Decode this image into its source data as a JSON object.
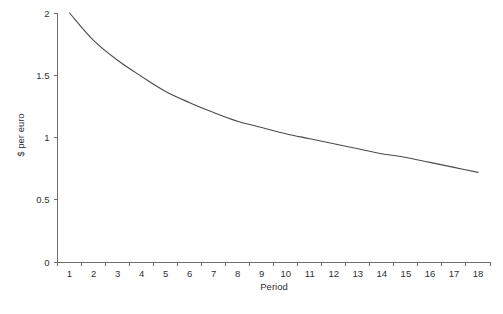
{
  "chart_data": {
    "type": "line",
    "title": "",
    "xlabel": "Period",
    "ylabel": "$ per euro",
    "x": [
      1,
      2,
      3,
      4,
      5,
      6,
      7,
      8,
      9,
      10,
      11,
      12,
      13,
      14,
      15,
      16,
      17,
      18
    ],
    "values": [
      2.0,
      1.78,
      1.62,
      1.49,
      1.37,
      1.28,
      1.2,
      1.13,
      1.08,
      1.03,
      0.99,
      0.95,
      0.91,
      0.87,
      0.84,
      0.8,
      0.76,
      0.72
    ],
    "series": [
      {
        "name": "$ per euro",
        "values": [
          2.0,
          1.78,
          1.62,
          1.49,
          1.37,
          1.28,
          1.2,
          1.13,
          1.08,
          1.03,
          0.99,
          0.95,
          0.91,
          0.87,
          0.84,
          0.8,
          0.76,
          0.72
        ]
      }
    ],
    "xlim": [
      1,
      18
    ],
    "ylim": [
      0,
      2
    ],
    "xticklabels": [
      "1",
      "2",
      "3",
      "4",
      "5",
      "6",
      "7",
      "8",
      "9",
      "10",
      "11",
      "12",
      "13",
      "14",
      "15",
      "16",
      "17",
      "18"
    ],
    "yticks": [
      0,
      0.5,
      1,
      1.5,
      2
    ],
    "yticklabels": [
      "0",
      "0.5",
      "1",
      "1.5",
      "2"
    ],
    "grid": false,
    "legend": false,
    "legend_position": "none",
    "line_color": "#4a4a4a",
    "axis_color": "#6e6e6e",
    "background_color": "#ffffff"
  },
  "axes": {
    "y_title": "$ per euro",
    "x_title": "Period"
  },
  "caption": {
    "text": ""
  }
}
